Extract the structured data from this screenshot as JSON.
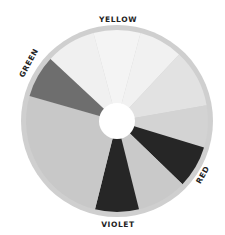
{
  "diagram": {
    "type": "color-wheel",
    "center": [
      117,
      121
    ],
    "outer_radius": 96,
    "rim_width": 5,
    "hub_radius": 18,
    "rim_color": "#cfcfcf",
    "hub_color": "#ffffff",
    "segments": [
      {
        "name": "yellow-left",
        "start": 313,
        "end": 345,
        "color": "#f0f0f0"
      },
      {
        "name": "yellow-center",
        "start": 345,
        "end": 15,
        "color": "#f4f4f4"
      },
      {
        "name": "yellow-right",
        "start": 15,
        "end": 43,
        "color": "#f1f1f1"
      },
      {
        "name": "orange-light",
        "start": 43,
        "end": 80,
        "color": "#e2e2e2"
      },
      {
        "name": "orange",
        "start": 80,
        "end": 107,
        "color": "#d3d3d3"
      },
      {
        "name": "red",
        "start": 107,
        "end": 134,
        "color": "#262626"
      },
      {
        "name": "red-violet",
        "start": 134,
        "end": 166,
        "color": "#c9c9c9"
      },
      {
        "name": "violet",
        "start": 166,
        "end": 194,
        "color": "#262626"
      },
      {
        "name": "blue",
        "start": 194,
        "end": 286,
        "color": "#c8c8c8"
      },
      {
        "name": "green",
        "start": 286,
        "end": 313,
        "color": "#6e6e6e"
      }
    ],
    "labels": [
      {
        "text": "YELLOW",
        "x": 118,
        "y": 22,
        "rotate": 0
      },
      {
        "text": "GREEN",
        "x": 31,
        "y": 64,
        "rotate": -62
      },
      {
        "text": "RED",
        "x": 205,
        "y": 176,
        "rotate": -60
      },
      {
        "text": "VIOLET",
        "x": 118,
        "y": 227,
        "rotate": 0
      }
    ]
  }
}
